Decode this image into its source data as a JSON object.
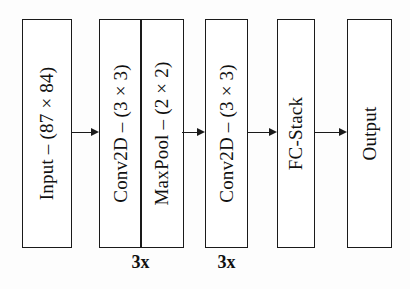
{
  "diagram": {
    "background_color": "#ffffff",
    "stroke_color": "#1a1a1a",
    "blocks": [
      {
        "id": "input",
        "label": "Input – (87 × 84)",
        "repeat": ""
      },
      {
        "id": "conv-pool-group",
        "label": "",
        "repeat": "3x",
        "children": [
          {
            "id": "conv2d-1",
            "label": "Conv2D – (3 × 3)"
          },
          {
            "id": "maxpool",
            "label": "MaxPool – (2 × 2)"
          }
        ]
      },
      {
        "id": "conv2d-2",
        "label": "Conv2D – (3 × 3)",
        "repeat": "3x"
      },
      {
        "id": "fc-stack",
        "label": "FC-Stack",
        "repeat": ""
      },
      {
        "id": "output",
        "label": "Output",
        "repeat": ""
      }
    ],
    "connections": [
      {
        "id": "arrow-input-to-conv-pool",
        "from": "input",
        "to": "conv-pool-group"
      },
      {
        "id": "arrow-conv-pool-to-conv2d-2",
        "from": "conv-pool-group",
        "to": "conv2d-2"
      },
      {
        "id": "arrow-conv2d-2-to-fc-stack",
        "from": "conv2d-2",
        "to": "fc-stack"
      },
      {
        "id": "arrow-fc-stack-to-output",
        "from": "fc-stack",
        "to": "output"
      }
    ]
  }
}
